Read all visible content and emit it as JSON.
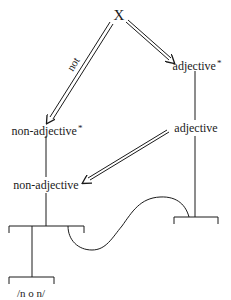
{
  "diagram": {
    "type": "feature-derivation-tree",
    "root": {
      "label": "X"
    },
    "nodes": {
      "adjective_star": {
        "label": "adjective",
        "marker": "*"
      },
      "adjective": {
        "label": "adjective"
      },
      "non_adjective_star": {
        "label": "non-adjective",
        "marker": "*"
      },
      "non_adjective": {
        "label": "non-adjective"
      }
    },
    "edges": [
      {
        "from": "X",
        "to": "non-adjective*",
        "style": "double-arrow",
        "label": "not"
      },
      {
        "from": "X",
        "to": "adjective*",
        "style": "double-arrow",
        "label": ""
      },
      {
        "from": "adjective*",
        "to": "adjective",
        "style": "line",
        "label": ""
      },
      {
        "from": "adjective",
        "to": "non-adjective",
        "style": "double-arrow",
        "label": ""
      },
      {
        "from": "non-adjective*",
        "to": "non-adjective",
        "style": "line",
        "label": ""
      },
      {
        "from": "adjective-bracket",
        "to": "non-adjective-bracket",
        "style": "curve",
        "label": ""
      }
    ],
    "edge_label_not": "not",
    "phonological_form": "/n o n/",
    "colors": {
      "ink": "#1a1a1a",
      "background": "#ffffff"
    }
  }
}
